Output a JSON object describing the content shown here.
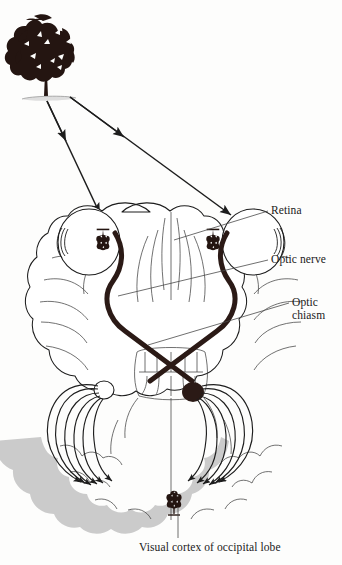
{
  "figure": {
    "type": "anatomical-diagram",
    "background_color": "#fdfdfc",
    "ink_color": "#1a1a1a",
    "cortex_band_color": "#c9c9c9",
    "tract_color": "#2b1a16"
  },
  "labels": {
    "retina": "Retina",
    "optic_nerve": "Optic nerve",
    "optic_chiasm_line1": "Optic",
    "optic_chiasm_line2": "chiasm",
    "visual_cortex": "Visual cortex of occipital lobe"
  },
  "objects": {
    "stimulus": "tree",
    "retinal_image": "inverted tree",
    "cortical_image": "tree"
  }
}
